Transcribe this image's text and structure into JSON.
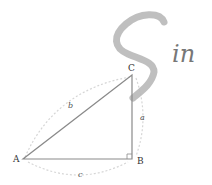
{
  "diagram": {
    "title_glyph": "S",
    "title_suffix": "in",
    "vertices": {
      "A": "A",
      "B": "B",
      "C": "C"
    },
    "sides": {
      "a": "a",
      "b": "b",
      "c": "c"
    },
    "colors": {
      "triangle": "#8a8a8a",
      "arcs": "#d6d6d6",
      "S_stroke": "#b8b8b8",
      "text": "#333333"
    }
  }
}
